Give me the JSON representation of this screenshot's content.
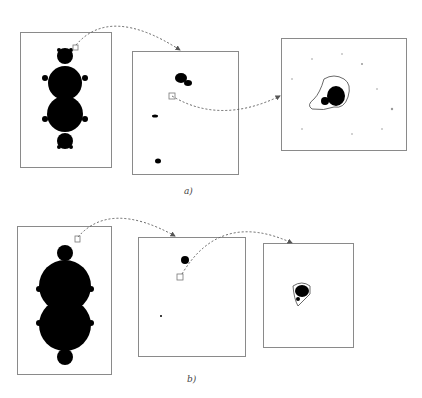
{
  "figure": {
    "rows": [
      {
        "label": "a)",
        "panels": [
          {
            "name": "full-set",
            "description": "Mandelbrot set overview with zoom box near top bulb"
          },
          {
            "name": "zoom-level-1",
            "description": "magnified region showing minibrot and filaments"
          },
          {
            "name": "zoom-level-2",
            "description": "deep zoom showing minibrot with dust"
          }
        ]
      },
      {
        "label": "b)",
        "panels": [
          {
            "name": "full-set",
            "description": "Mandelbrot set overview with zoom box near top bulb"
          },
          {
            "name": "zoom-level-1",
            "description": "magnified region with small minibrot"
          },
          {
            "name": "zoom-level-2",
            "description": "deep zoom showing minibrot"
          }
        ]
      }
    ],
    "colors": {
      "fill": "#000000",
      "border": "#8a8a8a",
      "arrow": "#555555"
    }
  }
}
